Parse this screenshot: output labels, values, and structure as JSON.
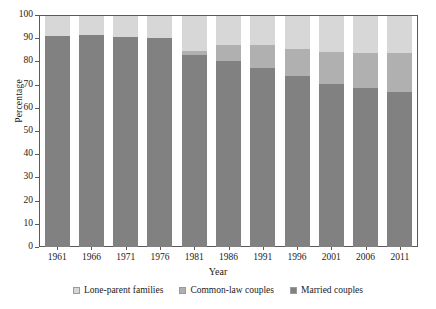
{
  "chart_data": {
    "type": "bar",
    "subtype": "stacked-bar-percentage",
    "title": "",
    "xlabel": "Year",
    "ylabel": "Percentage",
    "categories": [
      "1961",
      "1966",
      "1971",
      "1976",
      "1981",
      "1986",
      "1991",
      "1996",
      "2001",
      "2006",
      "2011"
    ],
    "ylim": [
      0,
      100
    ],
    "yticks": [
      0,
      10,
      20,
      30,
      40,
      50,
      60,
      70,
      80,
      90,
      100
    ],
    "ytick_labels": [
      "0",
      "10",
      "20",
      "30",
      "40",
      "50",
      "60",
      "70",
      "80",
      "90",
      "100"
    ],
    "grid": false,
    "stack_order_bottom_to_top": [
      "Married couples",
      "Common-law couples",
      "Lone-parent families"
    ],
    "legend_position": "bottom",
    "series": [
      {
        "name": "Married couples",
        "color": "#818181",
        "values": [
          91.5,
          91.8,
          90.8,
          90.5,
          83.0,
          80.5,
          77.3,
          74.0,
          70.7,
          68.9,
          67.3
        ]
      },
      {
        "name": "Common-law couples",
        "color": "#b0b0b0",
        "values": [
          0.0,
          0.0,
          0.0,
          0.0,
          2.0,
          7.0,
          10.0,
          11.6,
          13.8,
          15.1,
          16.6
        ]
      },
      {
        "name": "Lone-parent families",
        "color": "#d7d7d7",
        "values": [
          8.5,
          8.2,
          9.2,
          9.5,
          15.0,
          12.5,
          12.7,
          14.4,
          15.5,
          16.0,
          16.1
        ]
      }
    ]
  },
  "legend": {
    "items": [
      {
        "label": "Lone-parent families",
        "color": "#d7d7d7"
      },
      {
        "label": "Common-law couples",
        "color": "#b0b0b0"
      },
      {
        "label": "Married couples",
        "color": "#818181"
      }
    ]
  },
  "axes": {
    "x_title": "Year",
    "y_title": "Percentage"
  }
}
